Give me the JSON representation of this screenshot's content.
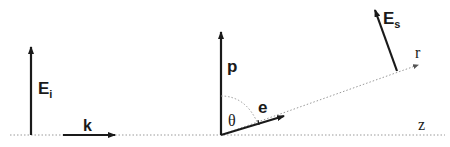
{
  "diagram": {
    "type": "scattering-geometry",
    "colors": {
      "ink": "#1a1a1a",
      "dotted": "#9a9a9a",
      "background": "#ffffff"
    },
    "labels": {
      "incident_field": {
        "main": "E",
        "sub": "i"
      },
      "wave_vector": "k",
      "dipole": "p",
      "unit_vector": "e",
      "angle": "θ",
      "scattered_field": {
        "main": "E",
        "sub": "s"
      },
      "radial_axis": "r",
      "z_axis": "z"
    }
  }
}
